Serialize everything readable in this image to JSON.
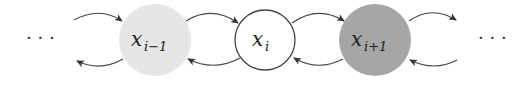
{
  "diagram": {
    "type": "chain",
    "left_ellipsis": "· · ·",
    "right_ellipsis": "· · ·",
    "nodes": [
      {
        "id": "x_prev",
        "base": "x",
        "sub": "i−1",
        "fill": "#e6e6e6",
        "stroke": "none"
      },
      {
        "id": "x_cur",
        "base": "x",
        "sub": "i",
        "fill": "#ffffff",
        "stroke": "#444444"
      },
      {
        "id": "x_next",
        "base": "x",
        "sub": "i+1",
        "fill": "#a6a6a6",
        "stroke": "none"
      }
    ],
    "edges": [
      {
        "from": "left",
        "to": "x_prev",
        "direction": "forward"
      },
      {
        "from": "x_prev",
        "to": "left",
        "direction": "backward"
      },
      {
        "from": "x_prev",
        "to": "x_cur",
        "direction": "forward"
      },
      {
        "from": "x_cur",
        "to": "x_prev",
        "direction": "backward"
      },
      {
        "from": "x_cur",
        "to": "x_next",
        "direction": "forward"
      },
      {
        "from": "x_next",
        "to": "x_cur",
        "direction": "backward"
      },
      {
        "from": "x_next",
        "to": "right",
        "direction": "forward"
      },
      {
        "from": "right",
        "to": "x_next",
        "direction": "backward"
      }
    ]
  }
}
